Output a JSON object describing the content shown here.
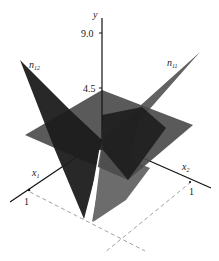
{
  "diagram": {
    "type": "3d-surface-plot",
    "axes": {
      "y": {
        "label": "y",
        "ticks": [
          "9.0",
          "4.5"
        ]
      },
      "x1": {
        "label": "x",
        "subscript": "1",
        "tick": "1"
      },
      "x2": {
        "label": "x",
        "subscript": "2",
        "tick": "1"
      }
    },
    "surfaces": [
      {
        "name": "n",
        "subscript": "12",
        "color": "#1e1e1e"
      },
      {
        "name": "n",
        "subscript": "11",
        "color": "#5a5a5a"
      },
      {
        "name": "horizontal-plane",
        "color": "#4a4a4a"
      }
    ],
    "colors": {
      "axis": "#111111",
      "dashed": "#9a9a9a",
      "background": "#ffffff"
    }
  }
}
